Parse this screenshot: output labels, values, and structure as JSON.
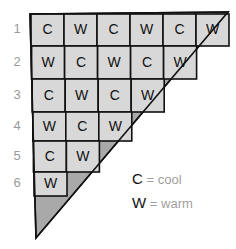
{
  "diagram": {
    "row_labels": [
      "1",
      "2",
      "3",
      "4",
      "5",
      "6"
    ],
    "rows": [
      [
        "C",
        "W",
        "C",
        "W",
        "C",
        "W"
      ],
      [
        "W",
        "C",
        "W",
        "C",
        "W"
      ],
      [
        "C",
        "W",
        "C",
        "W"
      ],
      [
        "W",
        "C",
        "W"
      ],
      [
        "C",
        "W"
      ],
      [
        "W"
      ]
    ],
    "legend": [
      {
        "symbol": "C",
        "sep": "=",
        "meaning": "cool"
      },
      {
        "symbol": "W",
        "sep": "=",
        "meaning": "warm"
      }
    ],
    "colors": {
      "cell_fill": "#d8d8d8",
      "shaded_fill": "#a9a9a9",
      "line": "#111111",
      "label": "#9a9a9a"
    }
  }
}
